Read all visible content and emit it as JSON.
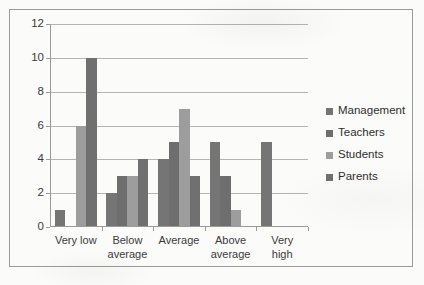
{
  "chart_data": {
    "type": "bar",
    "title": "",
    "subtitle": "",
    "xlabel": "",
    "ylabel": "",
    "ylim": [
      0,
      12
    ],
    "ytick_step": 2,
    "yticks": [
      0,
      2,
      4,
      6,
      8,
      10,
      12
    ],
    "ytick_labels": [
      "0",
      "2",
      "4",
      "6",
      "8",
      "10",
      "12"
    ],
    "grid": "horizontal",
    "legend_position": "right",
    "categories": [
      "Very low",
      "Below\naverage",
      "Average",
      "Above\naverage",
      "Very high"
    ],
    "series": [
      {
        "name": "Management",
        "color": "#757575",
        "values": [
          1,
          2,
          4,
          5,
          5
        ]
      },
      {
        "name": "Teachers",
        "color": "#6e6e6e",
        "values": [
          0,
          3,
          5,
          3,
          0
        ]
      },
      {
        "name": "Students",
        "color": "#9d9d9d",
        "values": [
          6,
          3,
          7,
          1,
          0
        ]
      },
      {
        "name": "Parents",
        "color": "#707070",
        "values": [
          10,
          4,
          3,
          0,
          0
        ]
      }
    ]
  },
  "legend": {
    "items": [
      {
        "label": "Management",
        "color": "#757575"
      },
      {
        "label": "Teachers",
        "color": "#6e6e6e"
      },
      {
        "label": "Students",
        "color": "#9d9d9d"
      },
      {
        "label": "Parents",
        "color": "#707070"
      }
    ]
  }
}
